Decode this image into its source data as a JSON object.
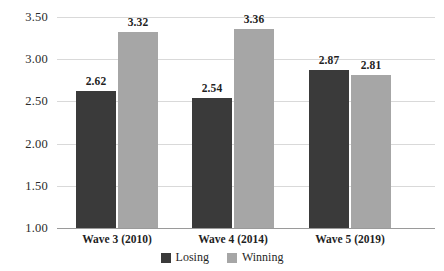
{
  "chart_data": {
    "type": "bar",
    "title": "",
    "subtitle": "",
    "xlabel": "",
    "ylabel": "",
    "ylim": [
      1.0,
      3.5
    ],
    "ytick_labels": [
      "3.50",
      "3.00",
      "2.50",
      "2.00",
      "1.50",
      "1.00"
    ],
    "ytick_values": [
      3.5,
      3.0,
      2.5,
      2.0,
      1.5,
      1.0
    ],
    "grid": true,
    "legend_position": "bottom-center",
    "categories": [
      "Wave 3 (2010)",
      "Wave 4 (2014)",
      "Wave 5 (2019)"
    ],
    "series": [
      {
        "name": "Losing",
        "color": "#3a3a3a",
        "values": [
          2.62,
          2.54,
          2.87
        ],
        "labels": [
          "2.62",
          "2.54",
          "2.87"
        ]
      },
      {
        "name": "Winning",
        "color": "#a6a6a6",
        "values": [
          3.32,
          3.36,
          2.81
        ],
        "labels": [
          "3.32",
          "3.36",
          "2.81"
        ]
      }
    ]
  },
  "legend": {
    "items": [
      {
        "label": "Losing",
        "color": "#3a3a3a"
      },
      {
        "label": "Winning",
        "color": "#a6a6a6"
      }
    ]
  },
  "axis": {
    "y": {
      "ticks": [
        {
          "label": "3.50"
        },
        {
          "label": "3.00"
        },
        {
          "label": "2.50"
        },
        {
          "label": "2.00"
        },
        {
          "label": "1.50"
        },
        {
          "label": "1.00"
        }
      ]
    },
    "x": {
      "ticks": [
        {
          "label": "Wave 3 (2010)"
        },
        {
          "label": "Wave 4 (2014)"
        },
        {
          "label": "Wave 5 (2019)"
        }
      ]
    }
  },
  "colors": {
    "losing": "#3a3a3a",
    "winning": "#a6a6a6",
    "gridline": "#d9d9d9",
    "baseline": "#9a9a9a",
    "text": "#1f1f1f",
    "background": "#ffffff"
  }
}
